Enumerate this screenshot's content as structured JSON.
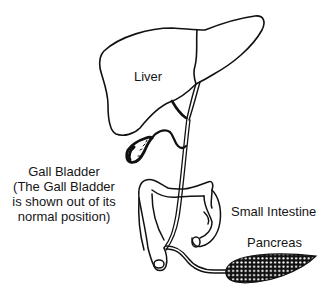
{
  "diagram": {
    "type": "anatomical illustration",
    "stroke_color": "#111111",
    "background": "#ffffff",
    "labels": {
      "liver": "Liver",
      "gall_bladder_title": "Gall Bladder",
      "gall_bladder_note_line1": "(The Gall Bladder",
      "gall_bladder_note_line2": "is shown out of its",
      "gall_bladder_note_line3": "normal position)",
      "small_intestine": "Small Intestine",
      "pancreas": "Pancreas"
    },
    "structures": [
      "liver",
      "gall-bladder",
      "cystic-duct",
      "hepatic-duct",
      "common-bile-duct",
      "small-intestine",
      "pancreatic-duct",
      "pancreas"
    ]
  }
}
